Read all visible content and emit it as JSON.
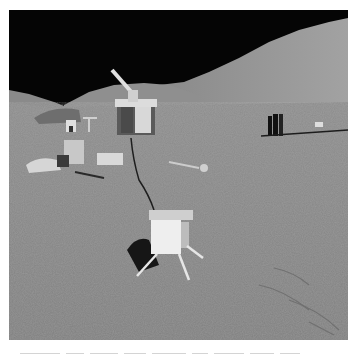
{
  "image": {
    "subject": "Lunar surface scene with scientific instruments and mountains",
    "colors": {
      "sky": "#050505",
      "mountain_far": "#9c9c9c",
      "mountain_near": "#8e8e8e",
      "ground": "#868686",
      "instrument_white": "#e8e8e8",
      "shadow": "#1a1a1a"
    }
  }
}
